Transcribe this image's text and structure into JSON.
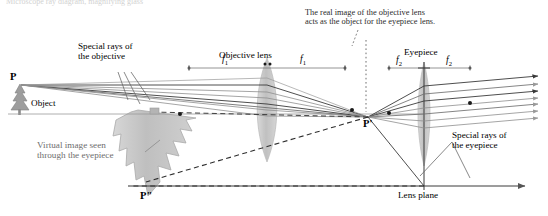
{
  "figure": {
    "partial_top_text": "Microscope ray diagram, magnifying glass",
    "callouts": {
      "objective_rays": "Special rays of\nthe objective",
      "eyepiece_rays": "Special rays of\nthe eyepiece",
      "virtual_image": "Virtual image seen\nthrough the eyepiece",
      "real_image_note": "The real image of the objective lens\nacts as the object for the eyepiece lens."
    },
    "parts": {
      "objective_lens": "Objective lens",
      "eyepiece": "Eyepiece",
      "object": "Object",
      "lens_plane": "Lens plane"
    },
    "points": {
      "p": "P",
      "p_prime": "P'",
      "p_double_prime": "P\""
    },
    "focal_labels": {
      "f1_left": "f",
      "f1_left_sub": "1",
      "f1_right": "f",
      "f1_right_sub": "1",
      "f2_left": "f",
      "f2_left_sub": "2",
      "f2_right": "f",
      "f2_right_sub": "2"
    },
    "colors": {
      "ray_dark": "#3a3a3a",
      "ray_light": "#8e8e8e",
      "lens_fill": "#c9c9c9",
      "virtual_image_fill": "#c6c6c6",
      "axis": "#555555",
      "text": "#000000"
    }
  }
}
